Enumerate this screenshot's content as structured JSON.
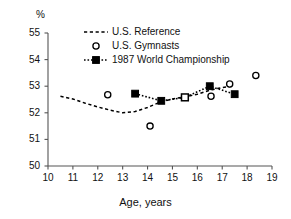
{
  "chart_data": {
    "type": "line",
    "title": "",
    "subtitle": "",
    "xlabel": "Age, years",
    "ylabel": "%",
    "ylabel_position": "top-left",
    "xlim": [
      10,
      19
    ],
    "ylim": [
      50,
      55
    ],
    "xticks": [
      10,
      11,
      12,
      13,
      14,
      15,
      16,
      17,
      18,
      19
    ],
    "yticks": [
      50,
      51,
      52,
      53,
      54,
      55
    ],
    "xtick_labels": [
      "10",
      "11",
      "12",
      "13",
      "14",
      "15",
      "16",
      "17",
      "18",
      "19"
    ],
    "ytick_labels": [
      "50",
      "51",
      "52",
      "53",
      "54",
      "55"
    ],
    "grid": false,
    "legend_position": "top-center",
    "series": [
      {
        "name": "U.S. Reference",
        "marker": "none",
        "linestyle": "dashed",
        "color": "#000000",
        "points": [
          {
            "x": 10.5,
            "y": 52.62
          },
          {
            "x": 11.0,
            "y": 52.52
          },
          {
            "x": 11.5,
            "y": 52.36
          },
          {
            "x": 12.0,
            "y": 52.22
          },
          {
            "x": 12.5,
            "y": 52.1
          },
          {
            "x": 13.0,
            "y": 52.0
          },
          {
            "x": 13.5,
            "y": 52.05
          },
          {
            "x": 14.0,
            "y": 52.2
          },
          {
            "x": 14.5,
            "y": 52.4
          },
          {
            "x": 15.0,
            "y": 52.52
          },
          {
            "x": 15.5,
            "y": 52.6
          },
          {
            "x": 16.0,
            "y": 52.7
          },
          {
            "x": 16.5,
            "y": 52.85
          },
          {
            "x": 17.0,
            "y": 52.95
          },
          {
            "x": 17.4,
            "y": 53.0
          }
        ]
      },
      {
        "name": "U.S. Gymnasts",
        "marker": "open-circle",
        "linestyle": "none",
        "color": "#000000",
        "points": [
          {
            "x": 12.4,
            "y": 52.68
          },
          {
            "x": 14.1,
            "y": 51.5
          },
          {
            "x": 16.55,
            "y": 52.62
          },
          {
            "x": 17.3,
            "y": 53.08
          },
          {
            "x": 18.35,
            "y": 53.4
          }
        ]
      },
      {
        "name": "1987 World Championship",
        "marker": "filled-square",
        "linestyle": "dotted",
        "color": "#000000",
        "points": [
          {
            "x": 13.5,
            "y": 52.72,
            "marker": "filled-square"
          },
          {
            "x": 14.55,
            "y": 52.45,
            "marker": "filled-square"
          },
          {
            "x": 15.5,
            "y": 52.58,
            "marker": "open-square"
          },
          {
            "x": 16.5,
            "y": 53.0,
            "marker": "filled-square"
          },
          {
            "x": 17.5,
            "y": 52.7,
            "marker": "filled-square"
          }
        ]
      }
    ]
  },
  "legend": {
    "entries": [
      {
        "label": "U.S. Reference",
        "key": "dashed-line-swatch"
      },
      {
        "label": "U.S. Gymnasts",
        "key": "open-circle-swatch"
      },
      {
        "label": "1987 World Championship",
        "key": "dotted-square-swatch"
      }
    ]
  },
  "axes": {
    "x_title": "Age, years",
    "y_unit": "%"
  },
  "colors": {
    "foreground": "#000000",
    "background": "#ffffff",
    "axis": "#555555"
  }
}
